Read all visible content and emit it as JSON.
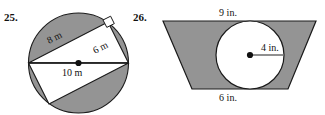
{
  "page": {
    "background_color": "#ffffff",
    "shaded_fill": "#949494",
    "unshaded_fill": "#ffffff",
    "outline_color": "#1a1a1a"
  },
  "exercises": [
    {
      "number": "25.",
      "figure": "circle-with-two-inscribed-right-triangles",
      "shape": "circle",
      "shaded_region": "circle minus two triangles",
      "labels": [
        {
          "name": "leg-8m",
          "text": "8 m"
        },
        {
          "name": "leg-6m",
          "text": "6 m"
        },
        {
          "name": "diameter-10m",
          "text": "10 m"
        }
      ],
      "markers": [
        {
          "name": "right-angle-marker",
          "text": ""
        },
        {
          "name": "center-dot",
          "text": ""
        }
      ]
    },
    {
      "number": "26.",
      "figure": "trapezoid-with-inscribed-circle",
      "shape": "trapezoid",
      "shaded_region": "trapezoid minus circle",
      "labels": [
        {
          "name": "top-base-9in",
          "text": "9 in."
        },
        {
          "name": "radius-4in",
          "text": "4 in."
        },
        {
          "name": "bottom-base-6in",
          "text": "6 in."
        }
      ],
      "markers": [
        {
          "name": "center-dot",
          "text": ""
        }
      ]
    }
  ]
}
